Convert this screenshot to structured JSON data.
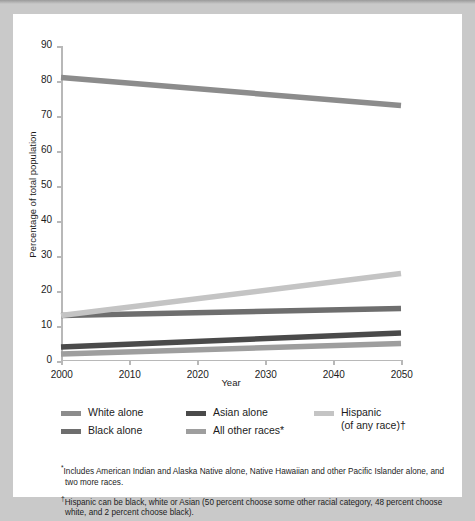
{
  "chart_data": {
    "type": "line",
    "title": "",
    "xlabel": "Year",
    "ylabel": "Percentage of total population",
    "x": [
      2000,
      2050
    ],
    "xlim": [
      2000,
      2050
    ],
    "ylim": [
      0,
      90
    ],
    "xticks": [
      "2000",
      "2010",
      "2020",
      "2030",
      "2040",
      "2050"
    ],
    "xtick_values": [
      2000,
      2010,
      2020,
      2030,
      2040,
      2050
    ],
    "yticks": [
      "0",
      "10",
      "20",
      "30",
      "40",
      "50",
      "60",
      "70",
      "80",
      "90"
    ],
    "ytick_values": [
      0,
      10,
      20,
      30,
      40,
      50,
      60,
      70,
      80,
      90
    ],
    "grid": false,
    "legend_position": "below-axes",
    "series": [
      {
        "name": "White alone",
        "color": "#8c8c8c",
        "x": [
          2000,
          2050
        ],
        "values": [
          81,
          73
        ]
      },
      {
        "name": "Black alone",
        "color": "#6e6e6e",
        "x": [
          2000,
          2050
        ],
        "values": [
          13,
          15
        ]
      },
      {
        "name": "Asian alone",
        "color": "#4a4a4a",
        "x": [
          2000,
          2050
        ],
        "values": [
          4,
          8
        ]
      },
      {
        "name": "All other races*",
        "color": "#9e9e9e",
        "x": [
          2000,
          2050
        ],
        "values": [
          2,
          5
        ]
      },
      {
        "name": "Hispanic\n(of any race)†",
        "color": "#c4c4c4",
        "x": [
          2000,
          2050
        ],
        "values": [
          13,
          25
        ]
      }
    ]
  },
  "legend": {
    "columns": [
      [
        {
          "label": "White alone",
          "color": "#8c8c8c",
          "swatch_name": "legend-swatch-white-alone"
        },
        {
          "label": "Black alone",
          "color": "#6e6e6e",
          "swatch_name": "legend-swatch-black-alone"
        }
      ],
      [
        {
          "label": "Asian alone",
          "color": "#4a4a4a",
          "swatch_name": "legend-swatch-asian-alone"
        },
        {
          "label": "All other races*",
          "color": "#9e9e9e",
          "swatch_name": "legend-swatch-all-other-races"
        }
      ],
      [
        {
          "label": "Hispanic\n(of any race)†",
          "color": "#c4c4c4",
          "swatch_name": "legend-swatch-hispanic"
        }
      ]
    ]
  },
  "footnotes": [
    "*Includes American Indian and Alaska Native alone, Native Hawaiian and other Pacific Islander alone, and two more races.",
    "†Hispanic can be black, white or Asian (50 percent choose some other racial category, 48 percent choose white, and 2 percent choose black)."
  ]
}
